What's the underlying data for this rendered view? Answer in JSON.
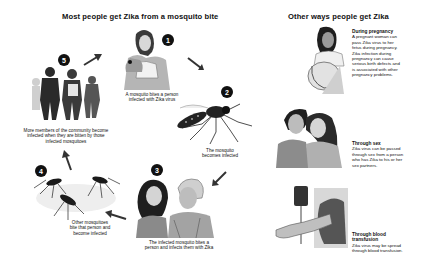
{
  "left_panel": {
    "title": "Most people get Zika from a mosquito bite",
    "steps": [
      {
        "number": "1",
        "caption_line1": "A mosquito bites a person",
        "caption_line2": "infected with Zika virus",
        "illustration": "woman-scratching-arm"
      },
      {
        "number": "2",
        "caption_line1": "The mosquito",
        "caption_line2": "becomes infected",
        "illustration": "mosquito"
      },
      {
        "number": "3",
        "caption_line1": "The infected mosquito bites a",
        "caption_line2": "person and infects them with Zika",
        "illustration": "couple-laughing"
      },
      {
        "number": "4",
        "caption_line1": "Other mosquitoes",
        "caption_line2": "bite that person and",
        "caption_line3": "become infected",
        "illustration": "mosquitoes-group"
      },
      {
        "number": "5",
        "caption_line1": "More members of the community become",
        "caption_line2": "infected when they are bitten by those",
        "caption_line3": "infected mosquitoes",
        "illustration": "people-walking"
      }
    ]
  },
  "right_panel": {
    "title": "Other ways people get Zika",
    "items": [
      {
        "heading": "During pregnancy",
        "text": [
          "A pregnant woman can",
          "pass Zika virus to her",
          "fetus during pregnancy.",
          "Zika infection during",
          "pregnancy can cause",
          "serious birth defects and",
          "is associated with other",
          "pregnancy problems."
        ],
        "illustration": "pregnant-woman"
      },
      {
        "heading": "Through sex",
        "text": [
          "Zika virus can be passed",
          "through sex from a person",
          "who has Zika to his or her",
          "sex partners."
        ],
        "illustration": "couple-embracing"
      },
      {
        "heading": "Through blood",
        "heading2": "transfusion",
        "text": [
          "Zika virus may be spread",
          "through blood transfusion."
        ],
        "illustration": "blood-transfusion"
      }
    ]
  },
  "colors": {
    "ink": "#111111",
    "background": "#ffffff",
    "shade": "#8a8a8a"
  }
}
